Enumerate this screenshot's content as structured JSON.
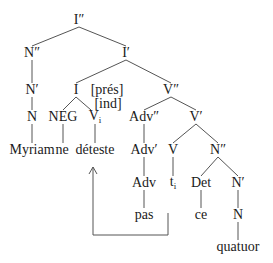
{
  "diagram": {
    "type": "syntax-tree",
    "nodes": [
      {
        "id": "Ipp",
        "label": "I″",
        "x": 79,
        "y": 20
      },
      {
        "id": "Npp",
        "label": "N″",
        "x": 32,
        "y": 53
      },
      {
        "id": "Ip",
        "label": "I′",
        "x": 126,
        "y": 53
      },
      {
        "id": "Np",
        "label": "N′",
        "x": 32,
        "y": 90
      },
      {
        "id": "I",
        "label": "I",
        "x": 76,
        "y": 90
      },
      {
        "id": "pres",
        "label": "[prés]",
        "x": 107,
        "y": 90
      },
      {
        "id": "ind",
        "label": "[ind]",
        "x": 108,
        "y": 104
      },
      {
        "id": "Vpp",
        "label": "V″",
        "x": 171,
        "y": 90
      },
      {
        "id": "N1",
        "label": "N",
        "x": 32,
        "y": 117
      },
      {
        "id": "NEG",
        "label": "NEG",
        "x": 63,
        "y": 117
      },
      {
        "id": "Vi",
        "label": "V",
        "sub": "i",
        "x": 95,
        "y": 117
      },
      {
        "id": "Advpp",
        "label": "Adv″",
        "x": 144,
        "y": 117
      },
      {
        "id": "Vp",
        "label": "V′",
        "x": 196,
        "y": 117
      },
      {
        "id": "Myriam",
        "label": "Myriam",
        "x": 32,
        "y": 150
      },
      {
        "id": "ne",
        "label": "ne",
        "x": 62,
        "y": 150
      },
      {
        "id": "deteste",
        "label": "déteste",
        "x": 95,
        "y": 150
      },
      {
        "id": "Advp",
        "label": "Adv′",
        "x": 144,
        "y": 150
      },
      {
        "id": "V",
        "label": "V",
        "x": 173,
        "y": 150
      },
      {
        "id": "Npp2",
        "label": "N″",
        "x": 218,
        "y": 150
      },
      {
        "id": "Adv",
        "label": "Adv",
        "x": 144,
        "y": 183
      },
      {
        "id": "ti",
        "label": "t",
        "sub": "i",
        "x": 173,
        "y": 183
      },
      {
        "id": "Det",
        "label": "Det",
        "x": 201,
        "y": 183
      },
      {
        "id": "Np2",
        "label": "N′",
        "x": 238,
        "y": 183
      },
      {
        "id": "pas",
        "label": "pas",
        "x": 144,
        "y": 215
      },
      {
        "id": "ce",
        "label": "ce",
        "x": 201,
        "y": 215
      },
      {
        "id": "N2",
        "label": "N",
        "x": 238,
        "y": 215
      },
      {
        "id": "quatuor",
        "label": "quatuor",
        "x": 238,
        "y": 247
      }
    ],
    "edges": [
      [
        79,
        27,
        32,
        46
      ],
      [
        79,
        27,
        126,
        46
      ],
      [
        32,
        60,
        32,
        83
      ],
      [
        126,
        60,
        76,
        83
      ],
      [
        126,
        60,
        171,
        83
      ],
      [
        32,
        97,
        32,
        110
      ],
      [
        76,
        97,
        63,
        110
      ],
      [
        76,
        97,
        91,
        110
      ],
      [
        171,
        97,
        144,
        110
      ],
      [
        171,
        97,
        196,
        110
      ],
      [
        32,
        124,
        32,
        143
      ],
      [
        63,
        124,
        63,
        143
      ],
      [
        95,
        124,
        95,
        143
      ],
      [
        144,
        124,
        144,
        143
      ],
      [
        196,
        124,
        173,
        143
      ],
      [
        196,
        124,
        218,
        143
      ],
      [
        144,
        157,
        144,
        176
      ],
      [
        173,
        157,
        173,
        176
      ],
      [
        218,
        157,
        201,
        176
      ],
      [
        218,
        157,
        238,
        176
      ],
      [
        144,
        190,
        144,
        208
      ],
      [
        201,
        190,
        201,
        208
      ],
      [
        238,
        190,
        238,
        208
      ],
      [
        238,
        222,
        238,
        240
      ]
    ],
    "movement_arrow": {
      "points": "168,213 168,235 93,235 93,167",
      "from": "t_i",
      "to": "V_i (déteste)"
    }
  }
}
